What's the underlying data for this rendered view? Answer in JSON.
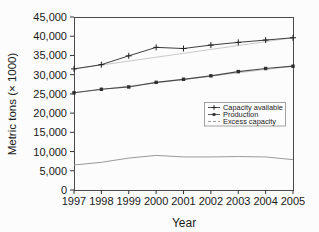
{
  "figure": {
    "background": "#fcfcfc",
    "plot_border_color": "#4a4a4a",
    "tick_color": "#333333",
    "tick_label_color": "#1a1a1a"
  },
  "chart_data": {
    "type": "line",
    "title": "",
    "xlabel": "Year",
    "ylabel": "Metric tons (× 1000)",
    "x": [
      1997,
      1998,
      1999,
      2000,
      2001,
      2002,
      2003,
      2004,
      2005
    ],
    "ylim": [
      0,
      45000
    ],
    "ytick_step": 5000,
    "grid": false,
    "legend_position": "inside-lower-right",
    "legend_border_color": "#8a8a8a",
    "series": [
      {
        "name": "Capacity available",
        "marker": "plus",
        "color": "#3f3f3f",
        "line_width": 1,
        "endpoint_straight_line": true,
        "values": [
          31500,
          32600,
          34900,
          37100,
          36800,
          37700,
          38400,
          39000,
          39600
        ]
      },
      {
        "name": "Production",
        "marker": "square",
        "color": "#4a4a4a",
        "line_width": 1.2,
        "endpoint_straight_line": true,
        "values": [
          25300,
          26200,
          26800,
          28000,
          28800,
          29700,
          30800,
          31600,
          32200
        ]
      },
      {
        "name": "Excess capacity",
        "marker": "none",
        "color": "#9a9a9a",
        "line_width": 1,
        "endpoint_straight_line": false,
        "values": [
          6500,
          7200,
          8300,
          9000,
          8600,
          8600,
          8700,
          8600,
          7900
        ]
      }
    ]
  }
}
